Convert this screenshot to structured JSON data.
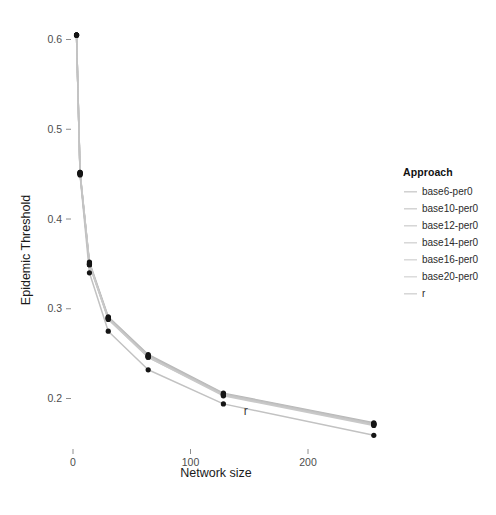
{
  "chart_data": {
    "type": "line",
    "title": "",
    "subtitle": "",
    "xlabel": "Network size",
    "ylabel": "Epidemic Threshold",
    "xlim": [
      -8,
      272
    ],
    "ylim": [
      0.175,
      0.625
    ],
    "xticks": [
      0,
      100,
      200
    ],
    "xticklabels": [
      "0",
      "100",
      "200"
    ],
    "yticks": [
      0.2,
      0.3,
      0.4,
      0.5,
      0.6
    ],
    "yticklabels": [
      "0.2",
      "0.3",
      "0.4",
      "0.5",
      "0.6"
    ],
    "grid": false,
    "background": "#ffffff",
    "legend_position": "right",
    "legend_title": "Approach",
    "markers": true,
    "x": [
      3,
      6,
      14,
      30,
      64,
      128,
      256
    ],
    "series": [
      {
        "name": "base6-per0",
        "color": "#b8b8b8",
        "values": [
          0.605,
          0.452,
          0.352,
          0.291,
          0.249,
          0.206,
          0.173
        ]
      },
      {
        "name": "base10-per0",
        "color": "#bdbdbd",
        "values": [
          0.605,
          0.452,
          0.351,
          0.29,
          0.248,
          0.205,
          0.172
        ]
      },
      {
        "name": "base12-per0",
        "color": "#c0c0c0",
        "values": [
          0.605,
          0.451,
          0.35,
          0.29,
          0.247,
          0.205,
          0.172
        ]
      },
      {
        "name": "base14-per0",
        "color": "#c3c3c3",
        "values": [
          0.605,
          0.451,
          0.35,
          0.289,
          0.247,
          0.204,
          0.171
        ]
      },
      {
        "name": "base16-per0",
        "color": "#c6c6c6",
        "values": [
          0.605,
          0.45,
          0.349,
          0.289,
          0.246,
          0.204,
          0.171
        ]
      },
      {
        "name": "base20-per0",
        "color": "#c9c9c9",
        "values": [
          0.605,
          0.45,
          0.349,
          0.288,
          0.246,
          0.203,
          0.17
        ]
      },
      {
        "name": "r",
        "color": "#c2c2c2",
        "values": [
          0.605,
          0.449,
          0.34,
          0.275,
          0.232,
          0.194,
          0.159
        ]
      }
    ],
    "annotations": [
      {
        "text": "r",
        "x": 147,
        "y": 0.182
      }
    ],
    "point_color": "#151515"
  },
  "axes": {
    "x_title": "Network size",
    "y_title": "Epidemic Threshold",
    "x_tick_0": "0",
    "x_tick_1": "100",
    "x_tick_2": "200",
    "y_tick_0": "0.2",
    "y_tick_1": "0.3",
    "y_tick_2": "0.4",
    "y_tick_3": "0.5",
    "y_tick_4": "0.6"
  },
  "legend": {
    "title": "Approach",
    "items": [
      {
        "label": "base6-per0",
        "color": "#b8b8b8"
      },
      {
        "label": "base10-per0",
        "color": "#bdbdbd"
      },
      {
        "label": "base12-per0",
        "color": "#c0c0c0"
      },
      {
        "label": "base14-per0",
        "color": "#c3c3c3"
      },
      {
        "label": "base16-per0",
        "color": "#c6c6c6"
      },
      {
        "label": "base20-per0",
        "color": "#c9c9c9"
      },
      {
        "label": "r",
        "color": "#c2c2c2"
      }
    ]
  },
  "annotation_r": "r"
}
